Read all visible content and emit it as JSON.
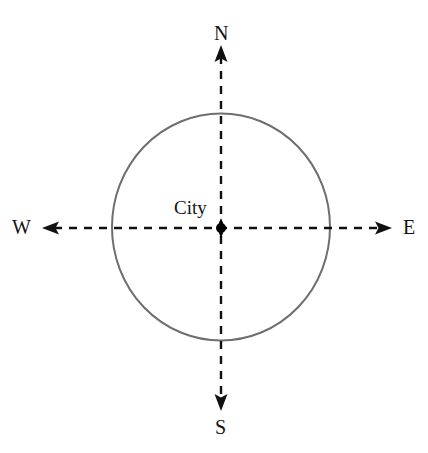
{
  "diagram": {
    "background_color": "#ffffff",
    "canvas": {
      "width": 428,
      "height": 453
    },
    "center_point": {
      "label": "City",
      "x": 221,
      "y": 228,
      "dot_color": "#000000",
      "dot_radius": 5
    },
    "circle": {
      "name": "city-boundary-circle",
      "center_x": 221,
      "center_y": 227,
      "radius_x": 109,
      "radius_y": 113,
      "stroke_color": "#6e6e6e",
      "stroke_width": 2,
      "fill": "none"
    },
    "axes": {
      "stroke_color": "#111111",
      "stroke_width": 2.4,
      "dash_pattern": "8 7",
      "vertical": {
        "x": 221,
        "y_top": 45,
        "y_bottom": 411
      },
      "horizontal": {
        "y": 228,
        "x_left": 42,
        "x_right": 390
      }
    },
    "directions": {
      "north": {
        "label": "N",
        "arrow": "up"
      },
      "south": {
        "label": "S",
        "arrow": "down"
      },
      "west": {
        "label": "W",
        "arrow": "left"
      },
      "east": {
        "label": "E",
        "arrow": "right"
      }
    }
  }
}
